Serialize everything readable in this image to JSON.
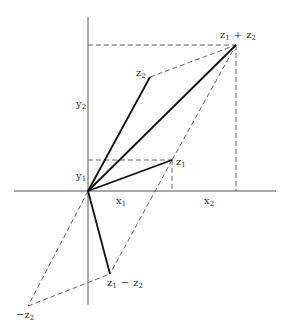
{
  "diagram": {
    "colors": {
      "background": "#ffffff",
      "stroke": "#111111",
      "axis": "#444444",
      "dashed": "#555555",
      "label": "#333333"
    },
    "origin": [
      88,
      191
    ],
    "points": {
      "z1": [
        172,
        160
      ],
      "z2": [
        150,
        77
      ],
      "sum": [
        236,
        45
      ],
      "diff": [
        110,
        274
      ],
      "neg_z2": [
        28,
        306
      ]
    },
    "labels": {
      "sum": {
        "base1": "z",
        "sub1": "1",
        "op": "+",
        "base2": "z",
        "sub2": "2"
      },
      "z2": {
        "base": "z",
        "sub": "2"
      },
      "z1": {
        "base": "z",
        "sub": "1"
      },
      "y2": {
        "base": "y",
        "sub": "2"
      },
      "y1": {
        "base": "y",
        "sub": "1"
      },
      "x1": {
        "base": "x",
        "sub": "1"
      },
      "x2": {
        "base": "x",
        "sub": "2"
      },
      "diff": {
        "base1": "z",
        "sub1": "1",
        "op": "−",
        "base2": "z",
        "sub2": "2"
      },
      "neg_z2": {
        "prefix": "−",
        "base": "z",
        "sub": "2"
      }
    }
  }
}
